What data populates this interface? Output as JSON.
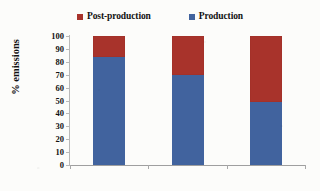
{
  "chart_data": {
    "type": "bar",
    "subtype": "stacked-100-percent",
    "title": "",
    "xlabel": "",
    "ylabel": "% emissions",
    "categories": [
      "Beef",
      "Swine",
      "Poultry"
    ],
    "series": [
      {
        "name": "Production",
        "values": [
          84,
          70,
          49
        ],
        "color": "#41639e"
      },
      {
        "name": "Post-production",
        "values": [
          16,
          30,
          51
        ],
        "color": "#a8332b"
      }
    ],
    "stack_order_bottom_to_top": [
      "Production",
      "Post-production"
    ],
    "ylim": [
      0,
      100
    ],
    "ytick_values": [
      0,
      10,
      20,
      30,
      40,
      50,
      60,
      70,
      80,
      90,
      100
    ],
    "ytick_labels": [
      "0",
      "10",
      "20",
      "30",
      "40",
      "50",
      "60",
      "70",
      "80",
      "90",
      "100"
    ],
    "grid": false,
    "legend_position": "top-center",
    "legend_entries": [
      {
        "label": "Post-production",
        "color": "#a8332b",
        "marker": "square-swatch"
      },
      {
        "label": "Production",
        "color": "#41639e",
        "marker": "square-swatch"
      }
    ]
  },
  "colors": {
    "production": "#41639e",
    "post_production": "#a8332b",
    "axis": "#b9b9b9",
    "text": "#111111",
    "background": "#fcfcfa"
  }
}
